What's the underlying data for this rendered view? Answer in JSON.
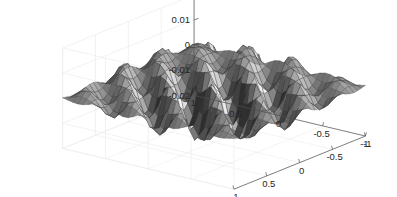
{
  "figure": {
    "background_color": "#ffffff",
    "plot_type": "3d-surface-mesh",
    "colormap": "gray"
  },
  "chart_data": {
    "type": "surface",
    "title": "",
    "xlabel": "",
    "ylabel": "",
    "zlabel": "",
    "grid": true,
    "legend": null,
    "colormap": "gray",
    "shading": "faceted",
    "mesh_edge_color": "#3a3a3a",
    "view": {
      "azimuth": -37.5,
      "elevation": 30
    },
    "x": {
      "ticks": [
        -1,
        -0.5,
        0,
        0.5,
        1
      ],
      "tick_labels": [
        "-1",
        "-0.5",
        "0",
        "0.5",
        "1"
      ],
      "range": [
        -1,
        1
      ],
      "axis_position": "bottom-right"
    },
    "y": {
      "ticks": [
        -1,
        -0.5,
        0,
        0.5,
        1
      ],
      "tick_labels": [
        "1",
        "0.5",
        "0",
        "-0.5",
        "-1"
      ],
      "range": [
        -1,
        1
      ],
      "axis_position": "bottom-left"
    },
    "z": {
      "ticks": [
        -0.02,
        -0.01,
        0,
        0.01,
        0.02
      ],
      "tick_labels": [
        "-0.02",
        "-0.01",
        "0",
        "0.01",
        "0.02"
      ],
      "range": [
        -0.02,
        0.02
      ],
      "axis_position": "left"
    },
    "zlim": [
      -0.02,
      0.02
    ],
    "surface_function": "0.018*cos(3.6*pi*x)*cos(3.6*pi*y)*exp(-1.1*(x*x+y*y))",
    "grid_resolution": {
      "nx": 34,
      "ny": 34
    },
    "z_min_observed": -0.02,
    "z_max_observed": 0.02
  },
  "axes": {
    "z_tick_labels": [
      "0.02",
      "0.01",
      "0",
      "-0.01",
      "-0.02"
    ],
    "y_tick_labels": [
      "1",
      "0.5",
      "0",
      "-0.5",
      "-1"
    ],
    "x_tick_labels": [
      "-1",
      "-0.5",
      "0",
      "0.5",
      "1"
    ]
  }
}
